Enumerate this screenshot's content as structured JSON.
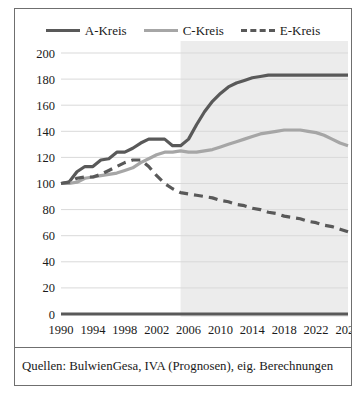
{
  "figure": {
    "caption": "Quellen: BulwienGesa, IVA (Prognosen), eig. Berechnungen"
  },
  "legend": {
    "position": "top-center",
    "entries": [
      {
        "label": "A-Kreis",
        "color": "#595959",
        "style": "solid"
      },
      {
        "label": "C-Kreis",
        "color": "#a6a6a6",
        "style": "solid"
      },
      {
        "label": "E-Kreis",
        "color": "#595959",
        "style": "dashed"
      }
    ]
  },
  "colors": {
    "a_kreis": "#595959",
    "c_kreis": "#a6a6a6",
    "e_kreis": "#595959",
    "gridline": "#d9d9d9",
    "axis": "#595959",
    "forecast_band": "#ececec",
    "frame": "#6f6f6f"
  },
  "chart_data": {
    "type": "line",
    "title": "",
    "xlabel": "",
    "ylabel": "",
    "xlim": [
      1990,
      2026
    ],
    "ylim": [
      0,
      200
    ],
    "ytick_step": 20,
    "xtick_step": 4,
    "grid": true,
    "legend_position": "top-center",
    "ytick_labels": [
      "0",
      "20",
      "40",
      "60",
      "80",
      "100",
      "120",
      "140",
      "160",
      "180",
      "200"
    ],
    "xtick_labels": [
      "1990",
      "1994",
      "1998",
      "2002",
      "2006",
      "2010",
      "2014",
      "2018",
      "2022",
      "2026"
    ],
    "annotations": [
      {
        "type": "shaded-band",
        "label": "Prognosezeitraum",
        "x_start": 2005,
        "x_end": 2026
      }
    ],
    "x": [
      1990,
      1991,
      1992,
      1993,
      1994,
      1995,
      1996,
      1997,
      1998,
      1999,
      2000,
      2001,
      2002,
      2003,
      2004,
      2005,
      2006,
      2007,
      2008,
      2009,
      2010,
      2011,
      2012,
      2013,
      2014,
      2015,
      2016,
      2017,
      2018,
      2019,
      2020,
      2021,
      2022,
      2023,
      2024,
      2025,
      2026
    ],
    "series": [
      {
        "name": "A-Kreis",
        "color": "#595959",
        "style": "solid",
        "values": [
          100,
          101,
          109,
          113,
          113,
          118,
          119,
          124,
          124,
          127,
          131,
          134,
          134,
          134,
          129,
          129,
          134,
          145,
          155,
          163,
          169,
          174,
          177,
          179,
          181,
          182,
          183,
          183,
          183,
          183,
          183,
          183,
          183,
          183,
          183,
          183,
          183
        ]
      },
      {
        "name": "C-Kreis",
        "color": "#a6a6a6",
        "style": "solid",
        "values": [
          100,
          100,
          101,
          104,
          105,
          106,
          107,
          108,
          110,
          112,
          116,
          119,
          122,
          124,
          124,
          125,
          124,
          124,
          125,
          126,
          128,
          130,
          132,
          134,
          136,
          138,
          139,
          140,
          141,
          141,
          141,
          140,
          139,
          137,
          134,
          131,
          129
        ]
      },
      {
        "name": "E-Kreis",
        "color": "#595959",
        "style": "dashed",
        "values": [
          100,
          101,
          104,
          105,
          105,
          107,
          110,
          113,
          116,
          118,
          118,
          113,
          106,
          100,
          96,
          93,
          92,
          91,
          90,
          89,
          87,
          86,
          84,
          83,
          81,
          80,
          78,
          77,
          75,
          74,
          73,
          71,
          70,
          68,
          67,
          65,
          63
        ]
      }
    ]
  }
}
